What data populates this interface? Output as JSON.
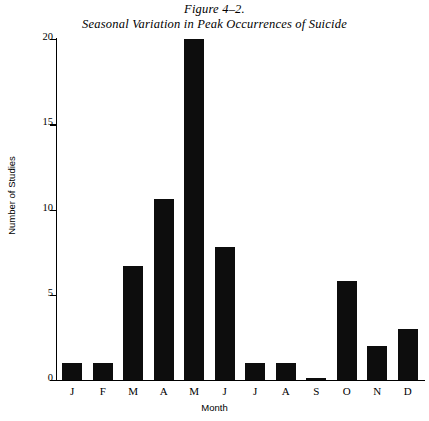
{
  "figure": {
    "title_line_1": "Figure 4–2.",
    "title_line_2": "Seasonal Variation in Peak Occurrences of Suicide"
  },
  "chart_data": {
    "type": "bar",
    "title": "Seasonal Variation in Peak Occurrences of Suicide",
    "subtitle": "Figure 4–2.",
    "xlabel": "Month",
    "ylabel": "Number of Studies",
    "categories": [
      "J",
      "F",
      "M",
      "A",
      "M",
      "J",
      "J",
      "A",
      "S",
      "O",
      "N",
      "D"
    ],
    "category_names": [
      "January",
      "February",
      "March",
      "April",
      "May",
      "June",
      "July",
      "August",
      "September",
      "October",
      "November",
      "December"
    ],
    "values": [
      1,
      1,
      6.7,
      10.6,
      20,
      7.8,
      1,
      1,
      0.1,
      5.8,
      2,
      3
    ],
    "ylim": [
      0,
      20
    ],
    "yticks": [
      0,
      5,
      10,
      15,
      20
    ],
    "ytick_labels": [
      "0",
      "5",
      "10",
      "15",
      "20"
    ],
    "grid": false,
    "legend": false,
    "bar_color": "#0d0d0d",
    "background_color": "#ffffff"
  }
}
